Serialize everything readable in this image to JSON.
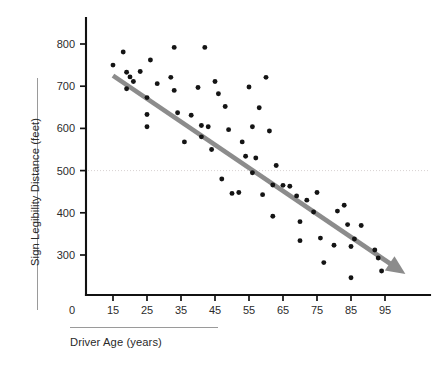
{
  "chart_data": {
    "type": "scatter",
    "title": "",
    "xlabel": "Driver Age (years)",
    "ylabel": "Sign Legibility Distance (feet)",
    "xlim": [
      10,
      102
    ],
    "ylim": [
      220,
      830
    ],
    "grid": false,
    "legend": null,
    "reference_lines": [
      {
        "axis": "y",
        "value": 500,
        "style": "dotted",
        "color": "#d8d2d2"
      }
    ],
    "annotations": [
      {
        "kind": "trend-arrow",
        "from": [
          15,
          725
        ],
        "to": [
          101,
          255
        ],
        "color": "#8c8c8c",
        "label": ""
      }
    ],
    "xticks": [
      15,
      25,
      35,
      45,
      55,
      65,
      75,
      85,
      95
    ],
    "xtick_labels": [
      "15",
      "25",
      "35",
      "45",
      "55",
      "65",
      "75",
      "85",
      "95"
    ],
    "yticks": [
      300,
      400,
      500,
      600,
      700,
      800
    ],
    "ytick_labels": [
      "300",
      "400",
      "500",
      "600",
      "700",
      "800"
    ],
    "origin_label": "0",
    "points": [
      [
        15,
        750
      ],
      [
        18,
        781
      ],
      [
        19,
        733
      ],
      [
        20,
        722
      ],
      [
        21,
        711
      ],
      [
        19,
        694
      ],
      [
        23,
        735
      ],
      [
        25,
        673
      ],
      [
        25,
        633
      ],
      [
        25,
        604
      ],
      [
        26,
        762
      ],
      [
        28,
        706
      ],
      [
        32,
        721
      ],
      [
        33,
        690
      ],
      [
        33,
        792
      ],
      [
        34,
        637
      ],
      [
        36,
        568
      ],
      [
        38,
        631
      ],
      [
        40,
        697
      ],
      [
        41,
        607
      ],
      [
        41,
        580
      ],
      [
        42,
        792
      ],
      [
        43,
        604
      ],
      [
        44,
        550
      ],
      [
        45,
        711
      ],
      [
        46,
        682
      ],
      [
        47,
        480
      ],
      [
        48,
        652
      ],
      [
        49,
        597
      ],
      [
        50,
        446
      ],
      [
        52,
        448
      ],
      [
        53,
        568
      ],
      [
        54,
        534
      ],
      [
        55,
        698
      ],
      [
        56,
        604
      ],
      [
        56,
        495
      ],
      [
        57,
        530
      ],
      [
        58,
        649
      ],
      [
        59,
        443
      ],
      [
        60,
        721
      ],
      [
        61,
        594
      ],
      [
        62,
        466
      ],
      [
        62,
        392
      ],
      [
        63,
        512
      ],
      [
        65,
        465
      ],
      [
        67,
        463
      ],
      [
        69,
        440
      ],
      [
        70,
        379
      ],
      [
        70,
        334
      ],
      [
        72,
        430
      ],
      [
        74,
        402
      ],
      [
        75,
        448
      ],
      [
        76,
        340
      ],
      [
        77,
        282
      ],
      [
        80,
        323
      ],
      [
        81,
        404
      ],
      [
        83,
        418
      ],
      [
        84,
        372
      ],
      [
        85,
        246
      ],
      [
        85,
        320
      ],
      [
        86,
        338
      ],
      [
        88,
        370
      ],
      [
        92,
        312
      ],
      [
        93,
        293
      ],
      [
        94,
        262
      ]
    ]
  }
}
